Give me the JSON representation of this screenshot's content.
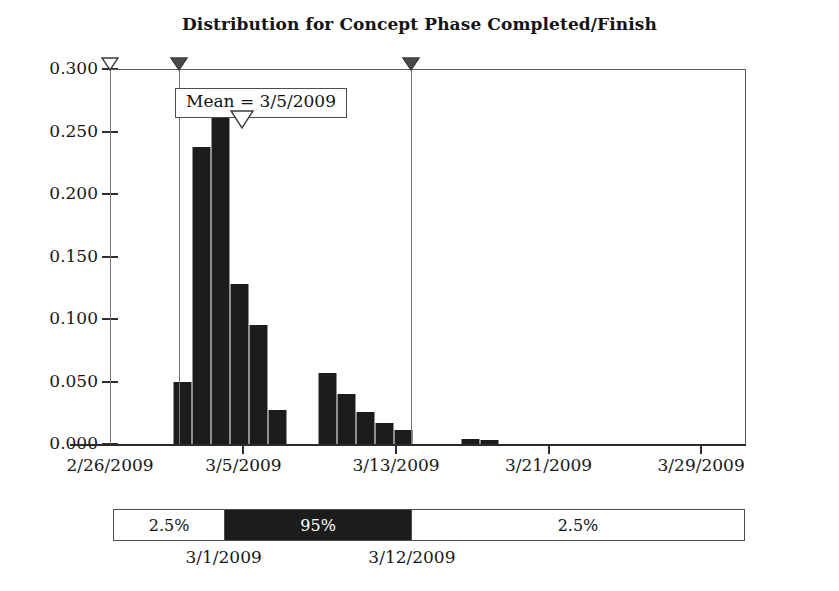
{
  "chart_data": {
    "type": "bar",
    "title": "Distribution for Concept Phase Completed/Finish",
    "xlabel": "",
    "ylabel": "",
    "grid": false,
    "legend_position": "none",
    "ylim": [
      0.0,
      0.3
    ],
    "y_ticks": [
      "0.000",
      "0.050",
      "0.100",
      "0.150",
      "0.200",
      "0.250",
      "0.300"
    ],
    "y_tick_values": [
      0.0,
      0.05,
      0.1,
      0.15,
      0.2,
      0.25,
      0.3
    ],
    "x_ticks": [
      "2/26/2009",
      "3/5/2009",
      "3/13/2009",
      "3/21/2009",
      "3/29/2009"
    ],
    "x_tick_values": [
      0,
      7,
      15,
      23,
      31
    ],
    "xlim": [
      0,
      33.3
    ],
    "categories": [
      "3/2/2009",
      "3/3/2009",
      "3/4/2009",
      "3/5/2009",
      "3/6/2009",
      "3/7/2009",
      "3/9/2009",
      "3/10/2009",
      "3/11/2009",
      "3/12/2009",
      "3/13/2009",
      "3/16/2009",
      "3/17/2009"
    ],
    "values": [
      0.05,
      0.238,
      0.268,
      0.128,
      0.095,
      0.027,
      0.057,
      0.04,
      0.026,
      0.017,
      0.011,
      0.004,
      0.003
    ],
    "bars": [
      {
        "label": "3/2/2009",
        "value": 0.05,
        "x0": 3.3,
        "x1": 4.3
      },
      {
        "label": "3/3/2009",
        "value": 0.238,
        "x0": 4.3,
        "x1": 5.3
      },
      {
        "label": "3/4/2009",
        "value": 0.268,
        "x0": 5.3,
        "x1": 6.3
      },
      {
        "label": "3/5/2009",
        "value": 0.128,
        "x0": 6.3,
        "x1": 7.3
      },
      {
        "label": "3/6/2009",
        "value": 0.095,
        "x0": 7.3,
        "x1": 8.3
      },
      {
        "label": "3/7/2009",
        "value": 0.027,
        "x0": 8.3,
        "x1": 9.3
      },
      {
        "label": "3/9/2009",
        "value": 0.057,
        "x0": 10.9,
        "x1": 11.9
      },
      {
        "label": "3/10/2009",
        "value": 0.04,
        "x0": 11.9,
        "x1": 12.9
      },
      {
        "label": "3/11/2009",
        "value": 0.026,
        "x0": 12.9,
        "x1": 13.9
      },
      {
        "label": "3/12/2009",
        "value": 0.017,
        "x0": 13.9,
        "x1": 14.9
      },
      {
        "label": "3/13/2009",
        "value": 0.011,
        "x0": 14.9,
        "x1": 15.9
      },
      {
        "label": "3/16/2009",
        "value": 0.004,
        "x0": 18.4,
        "x1": 19.4
      },
      {
        "label": "3/17/2009",
        "value": 0.003,
        "x0": 19.4,
        "x1": 20.4
      }
    ],
    "annotations": {
      "mean_label": "Mean = 3/5/2009",
      "mean_value": "3/5/2009",
      "mean_x": 6.9
    },
    "delimiters": [
      {
        "name": "left-bound",
        "style": "hollow",
        "x": 0.0
      },
      {
        "name": "lower-95-delimiter",
        "style": "filled",
        "x": 3.6
      },
      {
        "name": "upper-95-delimiter",
        "style": "filled",
        "x": 15.8
      }
    ],
    "percentile_bar": {
      "segments": [
        {
          "label": "2.5%",
          "fill": "light",
          "width_pct": 17.5
        },
        {
          "label": "95%",
          "fill": "dark",
          "width_pct": 29.8
        },
        {
          "label": "2.5%",
          "fill": "light",
          "width_pct": 52.7
        }
      ],
      "boundaries": [
        {
          "label": "3/1/2009",
          "left_pct": 17.5
        },
        {
          "label": "3/12/2009",
          "left_pct": 47.3
        }
      ]
    },
    "colors": {
      "bar_fill": "#1c1c1c",
      "bar_edge": "#8f8f8f",
      "axis": "#2f2f2f",
      "frame": "#5a5a5a",
      "delimiter_line": "#757575",
      "marker_filled": "#4a4a4a",
      "marker_hollow": "#ffffff",
      "percentile_dark": "#1c1c1c",
      "percentile_light": "#ffffff",
      "text": "#181818",
      "background": "#ffffff"
    }
  }
}
